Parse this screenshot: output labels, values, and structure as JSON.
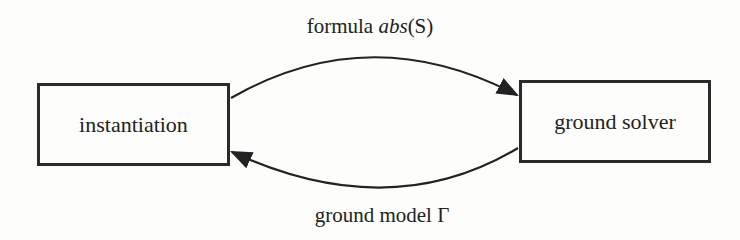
{
  "nodes": {
    "instantiation": {
      "label": "instantiation"
    },
    "ground_solver": {
      "label": "ground solver"
    }
  },
  "edges": {
    "top": {
      "prefix": "formula ",
      "math": "abs",
      "arg": "(S)"
    },
    "bottom": {
      "prefix": "ground model ",
      "symbol": "Γ"
    }
  }
}
